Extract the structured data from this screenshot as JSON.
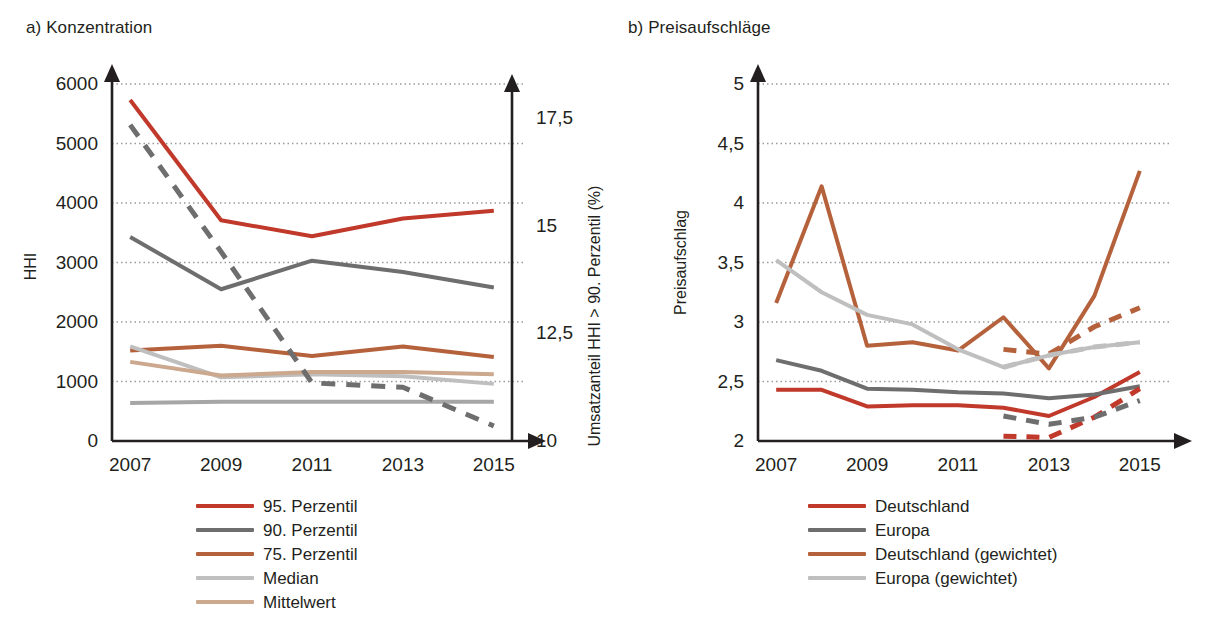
{
  "panels": {
    "a": {
      "title": "a) Konzentration"
    },
    "b": {
      "title": "b) Preisaufschläge"
    }
  },
  "colors": {
    "red": "#C0392B",
    "dark_gray": "#6E6E6E",
    "orange_brown": "#B5623C",
    "light_gray": "#BFBFBF",
    "tan": "#CBA88E",
    "mid_gray": "#A6A6A6",
    "grid": "#9a9a9a",
    "axis": "#231f20"
  },
  "chart_data": [
    {
      "id": "konzentration",
      "type": "line",
      "title": "a) Konzentration",
      "xlabel": "",
      "ylabel": "HHI",
      "ylabel_secondary": "Umsatzanteil HHI > 90. Perzentil (%)",
      "x": [
        2007,
        2008,
        2009,
        2010,
        2011,
        2012,
        2013,
        2014,
        2015
      ],
      "xticks": [
        "2007",
        "2009",
        "2011",
        "2013",
        "2015"
      ],
      "xtick_values": [
        2007,
        2009,
        2011,
        2013,
        2015
      ],
      "xlim": [
        2006.6,
        2015.4
      ],
      "ylim": [
        0,
        6000
      ],
      "yticks": [
        "0",
        "1000",
        "2000",
        "3000",
        "4000",
        "5000",
        "6000"
      ],
      "ytick_values": [
        0,
        1000,
        2000,
        3000,
        4000,
        5000,
        6000
      ],
      "ylim_secondary": [
        10,
        18.3
      ],
      "yticks_secondary": [
        "10",
        "12,5",
        "15",
        "17,5"
      ],
      "ytick_values_secondary": [
        10,
        12.5,
        15,
        17.5
      ],
      "grid": true,
      "legend_position": "below",
      "series": [
        {
          "name": "95. Perzentil",
          "color": "#C0392B",
          "style": "solid",
          "axis": "left",
          "x": [
            2007,
            2009,
            2011,
            2013,
            2015
          ],
          "values": [
            5730,
            3710,
            3440,
            3740,
            3870
          ]
        },
        {
          "name": "90. Perzentil",
          "color": "#6E6E6E",
          "style": "solid",
          "axis": "left",
          "x": [
            2007,
            2009,
            2011,
            2013,
            2015
          ],
          "values": [
            3430,
            2550,
            3030,
            2840,
            2580
          ]
        },
        {
          "name": "75. Perzentil",
          "color": "#B5623C",
          "style": "solid",
          "axis": "left",
          "x": [
            2007,
            2009,
            2011,
            2013,
            2015
          ],
          "values": [
            1520,
            1600,
            1430,
            1590,
            1410
          ]
        },
        {
          "name": "Median",
          "color": "#BFBFBF",
          "style": "solid",
          "axis": "left",
          "x": [
            2007,
            2009,
            2011,
            2013,
            2015
          ],
          "values": [
            1590,
            1070,
            1120,
            1090,
            960
          ]
        },
        {
          "name": "Mittelwert",
          "color": "#CBA88E",
          "style": "solid",
          "axis": "left",
          "x": [
            2007,
            2009,
            2011,
            2013,
            2015
          ],
          "values": [
            1330,
            1100,
            1160,
            1160,
            1120
          ]
        },
        {
          "name": "Median (unten)",
          "color": "#A6A6A6",
          "style": "solid",
          "axis": "left",
          "x": [
            2007,
            2009,
            2011,
            2013,
            2015
          ],
          "values": [
            640,
            660,
            660,
            660,
            660
          ]
        },
        {
          "name": "Umsatzanteil HHI > 90. Perzentil",
          "color": "#6E6E6E",
          "style": "dashed",
          "axis": "right",
          "x": [
            2007,
            2009,
            2011,
            2013,
            2015
          ],
          "values": [
            17.35,
            14.4,
            11.35,
            11.25,
            10.35
          ]
        }
      ],
      "legend": [
        {
          "label": "95. Perzentil",
          "color": "#C0392B",
          "style": "solid"
        },
        {
          "label": "90. Perzentil",
          "color": "#6E6E6E",
          "style": "solid"
        },
        {
          "label": "75. Perzentil",
          "color": "#B5623C",
          "style": "solid"
        },
        {
          "label": "Median",
          "color": "#BFBFBF",
          "style": "solid"
        },
        {
          "label": "Mittelwert",
          "color": "#CBA88E",
          "style": "solid"
        }
      ]
    },
    {
      "id": "preisaufschlaege",
      "type": "line",
      "title": "b) Preisaufschläge",
      "xlabel": "",
      "ylabel": "Preisaufschlag",
      "x": [
        2007,
        2008,
        2009,
        2010,
        2011,
        2012,
        2013,
        2014,
        2015
      ],
      "xticks": [
        "2007",
        "2009",
        "2011",
        "2013",
        "2015"
      ],
      "xtick_values": [
        2007,
        2009,
        2011,
        2013,
        2015
      ],
      "xlim": [
        2006.6,
        2015.4
      ],
      "ylim": [
        2,
        5
      ],
      "yticks": [
        "2",
        "2,5",
        "3",
        "3,5",
        "4",
        "4,5",
        "5"
      ],
      "ytick_values": [
        2,
        2.5,
        3,
        3.5,
        4,
        4.5,
        5
      ],
      "grid": true,
      "legend_position": "below",
      "series": [
        {
          "name": "Deutschland",
          "color": "#C0392B",
          "style": "solid",
          "x": [
            2007,
            2008,
            2009,
            2010,
            2011,
            2012,
            2013,
            2014,
            2015
          ],
          "values": [
            2.43,
            2.43,
            2.29,
            2.3,
            2.3,
            2.28,
            2.21,
            2.37,
            2.58
          ]
        },
        {
          "name": "Europa",
          "color": "#6E6E6E",
          "style": "solid",
          "x": [
            2007,
            2008,
            2009,
            2010,
            2011,
            2012,
            2013,
            2014,
            2015
          ],
          "values": [
            2.68,
            2.59,
            2.44,
            2.43,
            2.41,
            2.4,
            2.36,
            2.39,
            2.46
          ]
        },
        {
          "name": "Deutschland (gewichtet)",
          "color": "#B5623C",
          "style": "solid",
          "x": [
            2007,
            2008,
            2009,
            2010,
            2011,
            2012,
            2013,
            2014,
            2015
          ],
          "values": [
            3.16,
            4.14,
            2.8,
            2.83,
            2.76,
            3.04,
            2.61,
            3.22,
            4.27
          ]
        },
        {
          "name": "Europa (gewichtet)",
          "color": "#BFBFBF",
          "style": "solid",
          "x": [
            2007,
            2008,
            2009,
            2010,
            2011,
            2012,
            2013,
            2014,
            2015
          ],
          "values": [
            3.52,
            3.25,
            3.06,
            2.98,
            2.77,
            2.62,
            2.72,
            2.79,
            2.83
          ]
        },
        {
          "name": "Deutschland (gestrichelt)",
          "color": "#C0392B",
          "style": "dashed",
          "x": [
            2012,
            2013,
            2014,
            2015
          ],
          "values": [
            2.04,
            2.03,
            2.2,
            2.44
          ]
        },
        {
          "name": "Europa (gestrichelt)",
          "color": "#6E6E6E",
          "style": "dashed",
          "x": [
            2012,
            2013,
            2014,
            2015
          ],
          "values": [
            2.21,
            2.14,
            2.2,
            2.34
          ]
        },
        {
          "name": "Deutschland (gewichtet, gestrichelt)",
          "color": "#B5623C",
          "style": "dashed",
          "x": [
            2012,
            2013,
            2014,
            2015
          ],
          "values": [
            2.77,
            2.73,
            2.96,
            3.12
          ]
        },
        {
          "name": "Europa (gewichtet, gestrichelt)",
          "color": "#BFBFBF",
          "style": "dashed",
          "x": [
            2012,
            2013,
            2014,
            2015
          ],
          "values": [
            2.62,
            2.72,
            2.79,
            2.83
          ]
        }
      ],
      "legend": [
        {
          "label": "Deutschland",
          "color": "#C0392B",
          "style": "solid"
        },
        {
          "label": "Europa",
          "color": "#6E6E6E",
          "style": "solid"
        },
        {
          "label": "Deutschland (gewichtet)",
          "color": "#B5623C",
          "style": "solid"
        },
        {
          "label": "Europa (gewichtet)",
          "color": "#BFBFBF",
          "style": "solid"
        }
      ]
    }
  ]
}
